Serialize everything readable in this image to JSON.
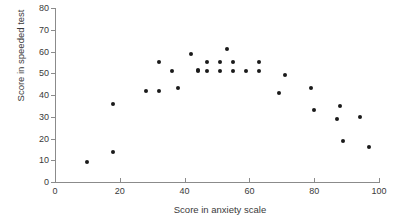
{
  "chart_data": {
    "type": "scatter",
    "title": "",
    "xlabel": "Score in anxiety scale",
    "ylabel": "Score in speeded test",
    "xlim": [
      0,
      100
    ],
    "ylim": [
      0,
      80
    ],
    "xticks": [
      0,
      20,
      40,
      60,
      80,
      100
    ],
    "yticks": [
      0,
      10,
      20,
      30,
      40,
      50,
      60,
      70,
      80
    ],
    "xtick_labels": [
      "0",
      "20",
      "40",
      "60",
      "80",
      "100"
    ],
    "ytick_labels": [
      "0",
      "10",
      "20",
      "30",
      "40",
      "50",
      "60",
      "70",
      "80"
    ],
    "grid": false,
    "legend": false,
    "marker": "filled-circle",
    "marker_color": "#1a1a1a",
    "axis_color": "#8b8b8b",
    "points": [
      {
        "x": 10,
        "y": 9
      },
      {
        "x": 18,
        "y": 14
      },
      {
        "x": 18,
        "y": 36
      },
      {
        "x": 28,
        "y": 42
      },
      {
        "x": 32,
        "y": 42
      },
      {
        "x": 32,
        "y": 55
      },
      {
        "x": 36,
        "y": 51
      },
      {
        "x": 38,
        "y": 43
      },
      {
        "x": 42,
        "y": 59
      },
      {
        "x": 44,
        "y": 51
      },
      {
        "x": 44,
        "y": 51.5
      },
      {
        "x": 47,
        "y": 55
      },
      {
        "x": 47,
        "y": 51
      },
      {
        "x": 51,
        "y": 55
      },
      {
        "x": 51,
        "y": 51
      },
      {
        "x": 53,
        "y": 61
      },
      {
        "x": 55,
        "y": 55
      },
      {
        "x": 55,
        "y": 51
      },
      {
        "x": 59,
        "y": 51
      },
      {
        "x": 63,
        "y": 55
      },
      {
        "x": 63,
        "y": 51
      },
      {
        "x": 69,
        "y": 41
      },
      {
        "x": 71,
        "y": 49
      },
      {
        "x": 79,
        "y": 43
      },
      {
        "x": 80,
        "y": 33
      },
      {
        "x": 87,
        "y": 29
      },
      {
        "x": 88,
        "y": 35
      },
      {
        "x": 89,
        "y": 19
      },
      {
        "x": 94,
        "y": 30
      },
      {
        "x": 97,
        "y": 16
      }
    ]
  }
}
